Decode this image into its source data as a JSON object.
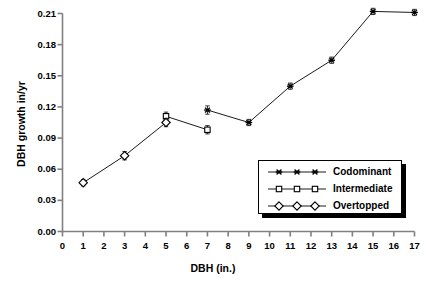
{
  "chart_data": {
    "type": "line",
    "title": "",
    "subtitle": "",
    "xlabel": "DBH (in.)",
    "ylabel": "DBH growth in/yr",
    "xlim": [
      0,
      17
    ],
    "ylim": [
      0.0,
      0.21
    ],
    "xticks": [
      0,
      1,
      2,
      3,
      4,
      5,
      6,
      7,
      8,
      9,
      10,
      11,
      12,
      13,
      14,
      15,
      16,
      17
    ],
    "xtick_labels": [
      "0",
      "1",
      "2",
      "3",
      "4",
      "5",
      "6",
      "7",
      "8",
      "9",
      "10",
      "11",
      "12",
      "13",
      "14",
      "15",
      "16",
      "17"
    ],
    "yticks": [
      0.0,
      0.03,
      0.06,
      0.09,
      0.12,
      0.15,
      0.18,
      0.21
    ],
    "ytick_labels": [
      "0.00",
      "0.03",
      "0.06",
      "0.09",
      "0.12",
      "0.15",
      "0.18",
      "0.21"
    ],
    "grid": false,
    "legend_position": "center-right",
    "error_bars": true,
    "series": [
      {
        "name": "Codominant",
        "marker": "star",
        "color": "#000000",
        "x": [
          7,
          9,
          11,
          13,
          15,
          17
        ],
        "y": [
          0.117,
          0.105,
          0.14,
          0.165,
          0.212,
          0.211
        ],
        "yerr": [
          0.004,
          0.003,
          0.003,
          0.003,
          0.003,
          0.003
        ]
      },
      {
        "name": "Intermediate",
        "marker": "square",
        "color": "#000000",
        "x": [
          5,
          7
        ],
        "y": [
          0.111,
          0.098
        ],
        "yerr": [
          0.004,
          0.004
        ]
      },
      {
        "name": "Overtopped",
        "marker": "diamond",
        "color": "#000000",
        "x": [
          1,
          3,
          5
        ],
        "y": [
          0.047,
          0.073,
          0.105
        ],
        "yerr": [
          0.003,
          0.004,
          0.004
        ]
      }
    ]
  },
  "legend": {
    "entries": [
      {
        "label": "Codominant",
        "marker": "star"
      },
      {
        "label": "Intermediate",
        "marker": "square"
      },
      {
        "label": "Overtopped",
        "marker": "diamond"
      }
    ]
  },
  "axes": {
    "x_title": "DBH (in.)",
    "y_title": "DBH growth in/yr"
  }
}
